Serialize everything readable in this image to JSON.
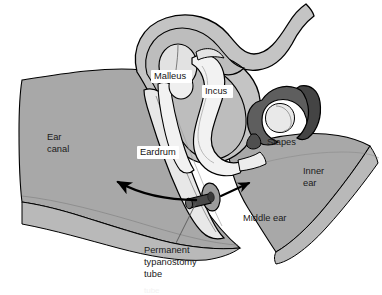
{
  "figure": {
    "background_color": "#ffffff"
  },
  "palette": {
    "outline": "#000000",
    "canal_fill": "#a8a8a8",
    "canal_fill_dark": "#9a9a9a",
    "canal_fill_light": "#b9b9b9",
    "wall_fill": "#c4c4c4",
    "cavity_fill": "#bdbdbd",
    "ossicle_fill": "#f2f2f2",
    "ossicle_shade": "#d8d8d8",
    "stapes_fill": "#5e5e5e",
    "stapes_shade": "#444444",
    "tube_fill": "#4a4a4a",
    "tube_flange": "#8f8f8f",
    "label_box": "#ffffff",
    "text": "#1a1a1a"
  },
  "labels": [
    {
      "id": "malleus",
      "text": "Malleus",
      "boxed": true,
      "x": 154,
      "y": 77,
      "align": "start"
    },
    {
      "id": "incus",
      "text": "Incus",
      "boxed": true,
      "x": 205,
      "y": 92,
      "align": "start"
    },
    {
      "id": "stapes",
      "text": "Stapes",
      "boxed": false,
      "x": 267,
      "y": 143,
      "align": "start"
    },
    {
      "id": "eardrum",
      "text": "Eardrum",
      "boxed": true,
      "x": 140,
      "y": 153,
      "align": "start"
    },
    {
      "id": "middle-ear",
      "text": "Middle ear",
      "boxed": false,
      "x": 243,
      "y": 219,
      "align": "start"
    }
  ],
  "multiline_labels": [
    {
      "id": "ear-canal",
      "lines": [
        "Ear",
        "canal"
      ],
      "x": 47,
      "y": 138,
      "line_height": 12,
      "align": "start"
    },
    {
      "id": "inner-ear",
      "lines": [
        "Inner",
        "ear"
      ],
      "x": 303,
      "y": 172,
      "line_height": 12,
      "align": "start"
    },
    {
      "id": "permanent-typanostomy-tube",
      "lines": [
        "Permanent",
        "typanostomy",
        "tube"
      ],
      "x": 144,
      "y": 251,
      "line_height": 12,
      "align": "start"
    }
  ],
  "callouts": [
    {
      "id": "tube-leader-line",
      "from_x": 176,
      "from_y": 243,
      "to_x": 196,
      "to_y": 202
    }
  ],
  "arrows": [
    {
      "id": "sound-in-arrow",
      "direction": "up-left",
      "label": "airflow/sound toward ear canal"
    },
    {
      "id": "drainage-arrow",
      "direction": "up-right",
      "label": "drainage through tube into middle ear"
    }
  ],
  "bottom_edge_text": "tube"
}
